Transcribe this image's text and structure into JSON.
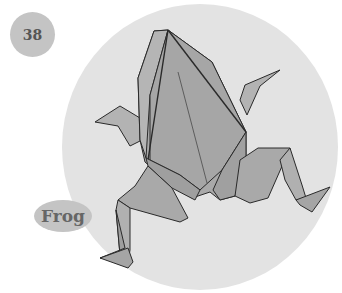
{
  "page_number": "38",
  "label": "Frog",
  "colors": {
    "badge": "#c4c4c4",
    "circle": "#e3e3e3",
    "paper": "#a9a9a9",
    "paper_light": "#b8b8b8",
    "paper_dark": "#999999",
    "line": "#2a2a2a"
  }
}
